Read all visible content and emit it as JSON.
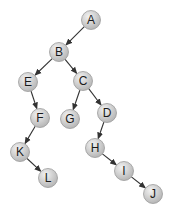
{
  "diagram": {
    "type": "tree",
    "node_radius": 9.5,
    "colors": {
      "node_fill_light": "#f2f2f2",
      "node_fill_dark": "#b5b5b5",
      "node_stroke": "#9a9a9a",
      "edge": "#333333",
      "label": "#1a1a1a"
    },
    "nodes": [
      {
        "id": "A",
        "label": "A",
        "x": 91,
        "y": 20
      },
      {
        "id": "B",
        "label": "B",
        "x": 59,
        "y": 52
      },
      {
        "id": "E",
        "label": "E",
        "x": 28,
        "y": 82
      },
      {
        "id": "C",
        "label": "C",
        "x": 83,
        "y": 81
      },
      {
        "id": "F",
        "label": "F",
        "x": 40,
        "y": 118
      },
      {
        "id": "G",
        "label": "G",
        "x": 70,
        "y": 119
      },
      {
        "id": "D",
        "label": "D",
        "x": 107,
        "y": 113
      },
      {
        "id": "K",
        "label": "K",
        "x": 20,
        "y": 152
      },
      {
        "id": "H",
        "label": "H",
        "x": 95,
        "y": 148
      },
      {
        "id": "L",
        "label": "L",
        "x": 48,
        "y": 178
      },
      {
        "id": "I",
        "label": "I",
        "x": 124,
        "y": 171
      },
      {
        "id": "J",
        "label": "J",
        "x": 153,
        "y": 194
      }
    ],
    "edges": [
      {
        "from": "A",
        "to": "B"
      },
      {
        "from": "B",
        "to": "E"
      },
      {
        "from": "B",
        "to": "C"
      },
      {
        "from": "E",
        "to": "F"
      },
      {
        "from": "C",
        "to": "G"
      },
      {
        "from": "C",
        "to": "D"
      },
      {
        "from": "F",
        "to": "K"
      },
      {
        "from": "D",
        "to": "H"
      },
      {
        "from": "K",
        "to": "L"
      },
      {
        "from": "H",
        "to": "I"
      },
      {
        "from": "I",
        "to": "J"
      }
    ]
  }
}
